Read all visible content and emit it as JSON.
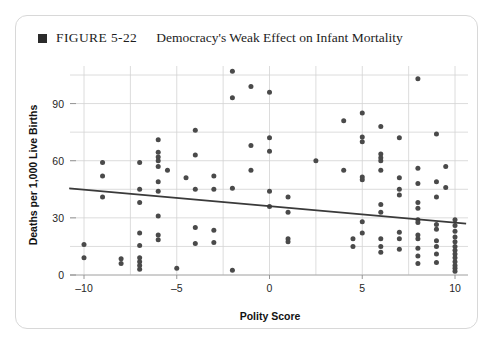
{
  "figure": {
    "bullet": "filled-square",
    "label": "FIGURE 5-22",
    "title": "Democracy's Weak Effect on Infant Mortality"
  },
  "chart_data": {
    "type": "scatter",
    "title": "Democracy's Weak Effect on Infant Mortality",
    "xlabel": "Polity Score",
    "ylabel": "Deaths per 1,000 Live Births",
    "xlim": [
      -11.5,
      11.5
    ],
    "ylim": [
      -5,
      110
    ],
    "xticks": [
      -10,
      -5,
      0,
      5,
      10
    ],
    "xticklabels": [
      "–10",
      "–5",
      "0",
      "5",
      "10"
    ],
    "yticks": [
      0,
      30,
      60,
      90
    ],
    "yticklabels": [
      "0",
      "30",
      "60",
      "90"
    ],
    "x_gridlines": [
      -10,
      -7.5,
      -5,
      -2.5,
      0,
      2.5,
      5,
      7.5,
      10
    ],
    "y_gridlines": [
      0,
      15,
      30,
      45,
      60,
      75,
      90,
      105
    ],
    "grid": true,
    "legend": "none",
    "marker_color": "#4a4a4a",
    "trendline": {
      "label": "linear fit",
      "color": "#3a3a3a",
      "x": [
        -10.8,
        10.6
      ],
      "y": [
        45.5,
        27.0
      ]
    },
    "points": [
      {
        "x": -10.0,
        "y": 16.0
      },
      {
        "x": -10.0,
        "y": 9.0
      },
      {
        "x": -9.0,
        "y": 59.0
      },
      {
        "x": -9.0,
        "y": 52.0
      },
      {
        "x": -9.0,
        "y": 41.0
      },
      {
        "x": -8.0,
        "y": 8.5
      },
      {
        "x": -8.0,
        "y": 6.0
      },
      {
        "x": -7.0,
        "y": 59.0
      },
      {
        "x": -7.0,
        "y": 45.0
      },
      {
        "x": -7.0,
        "y": 38.0
      },
      {
        "x": -7.0,
        "y": 22.0
      },
      {
        "x": -7.0,
        "y": 15.5
      },
      {
        "x": -7.0,
        "y": 9.0
      },
      {
        "x": -7.0,
        "y": 7.0
      },
      {
        "x": -7.0,
        "y": 5.0
      },
      {
        "x": -7.0,
        "y": 3.0
      },
      {
        "x": -6.0,
        "y": 71.0
      },
      {
        "x": -6.0,
        "y": 64.5
      },
      {
        "x": -6.0,
        "y": 62.0
      },
      {
        "x": -6.0,
        "y": 60.0
      },
      {
        "x": -6.0,
        "y": 57.0
      },
      {
        "x": -6.0,
        "y": 49.0
      },
      {
        "x": -6.0,
        "y": 44.0
      },
      {
        "x": -6.0,
        "y": 31.0
      },
      {
        "x": -6.0,
        "y": 21.0
      },
      {
        "x": -6.0,
        "y": 18.5
      },
      {
        "x": -5.5,
        "y": 55.0
      },
      {
        "x": -5.0,
        "y": 3.5
      },
      {
        "x": -4.5,
        "y": 51.0
      },
      {
        "x": -4.0,
        "y": 76.0
      },
      {
        "x": -4.0,
        "y": 63.0
      },
      {
        "x": -4.0,
        "y": 45.0
      },
      {
        "x": -4.0,
        "y": 25.0
      },
      {
        "x": -4.0,
        "y": 16.5
      },
      {
        "x": -3.0,
        "y": 52.0
      },
      {
        "x": -3.0,
        "y": 45.0
      },
      {
        "x": -3.0,
        "y": 23.5
      },
      {
        "x": -3.0,
        "y": 17.0
      },
      {
        "x": -2.0,
        "y": 107.0
      },
      {
        "x": -2.0,
        "y": 93.0
      },
      {
        "x": -2.0,
        "y": 45.5
      },
      {
        "x": -2.0,
        "y": 2.5
      },
      {
        "x": -1.0,
        "y": 99.0
      },
      {
        "x": -1.0,
        "y": 68.0
      },
      {
        "x": -1.0,
        "y": 55.0
      },
      {
        "x": 0.0,
        "y": 96.0
      },
      {
        "x": 0.0,
        "y": 72.0
      },
      {
        "x": 0.0,
        "y": 65.0
      },
      {
        "x": 0.0,
        "y": 44.0
      },
      {
        "x": 0.0,
        "y": 36.0
      },
      {
        "x": 1.0,
        "y": 41.0
      },
      {
        "x": 1.0,
        "y": 33.0
      },
      {
        "x": 1.0,
        "y": 19.0
      },
      {
        "x": 1.0,
        "y": 17.5
      },
      {
        "x": 2.5,
        "y": 60.0
      },
      {
        "x": 4.0,
        "y": 81.0
      },
      {
        "x": 4.0,
        "y": 55.0
      },
      {
        "x": 4.5,
        "y": 19.0
      },
      {
        "x": 4.5,
        "y": 15.0
      },
      {
        "x": 5.0,
        "y": 85.0
      },
      {
        "x": 5.0,
        "y": 72.5
      },
      {
        "x": 5.0,
        "y": 70.0
      },
      {
        "x": 5.0,
        "y": 51.5
      },
      {
        "x": 5.0,
        "y": 50.0
      },
      {
        "x": 5.0,
        "y": 28.0
      },
      {
        "x": 5.0,
        "y": 22.0
      },
      {
        "x": 6.0,
        "y": 78.0
      },
      {
        "x": 6.0,
        "y": 63.5
      },
      {
        "x": 6.0,
        "y": 61.5
      },
      {
        "x": 6.0,
        "y": 60.0
      },
      {
        "x": 6.0,
        "y": 55.0
      },
      {
        "x": 6.0,
        "y": 37.0
      },
      {
        "x": 6.0,
        "y": 33.0
      },
      {
        "x": 6.0,
        "y": 19.0
      },
      {
        "x": 6.0,
        "y": 15.0
      },
      {
        "x": 6.0,
        "y": 12.0
      },
      {
        "x": 7.0,
        "y": 72.0
      },
      {
        "x": 7.0,
        "y": 51.0
      },
      {
        "x": 7.0,
        "y": 45.0
      },
      {
        "x": 7.0,
        "y": 42.0
      },
      {
        "x": 7.0,
        "y": 22.5
      },
      {
        "x": 7.0,
        "y": 19.0
      },
      {
        "x": 7.0,
        "y": 13.5
      },
      {
        "x": 8.0,
        "y": 103.0
      },
      {
        "x": 8.0,
        "y": 56.0
      },
      {
        "x": 8.0,
        "y": 48.0
      },
      {
        "x": 8.0,
        "y": 38.0
      },
      {
        "x": 8.0,
        "y": 35.0
      },
      {
        "x": 8.0,
        "y": 29.0
      },
      {
        "x": 8.0,
        "y": 27.5
      },
      {
        "x": 8.0,
        "y": 21.0
      },
      {
        "x": 8.0,
        "y": 19.0
      },
      {
        "x": 8.0,
        "y": 14.0
      },
      {
        "x": 8.0,
        "y": 10.0
      },
      {
        "x": 8.0,
        "y": 6.0
      },
      {
        "x": 9.0,
        "y": 74.0
      },
      {
        "x": 9.0,
        "y": 49.0
      },
      {
        "x": 9.0,
        "y": 41.0
      },
      {
        "x": 9.0,
        "y": 26.5
      },
      {
        "x": 9.0,
        "y": 24.0
      },
      {
        "x": 9.0,
        "y": 18.0
      },
      {
        "x": 9.0,
        "y": 15.0
      },
      {
        "x": 9.0,
        "y": 11.0
      },
      {
        "x": 9.0,
        "y": 6.5
      },
      {
        "x": 9.5,
        "y": 57.0
      },
      {
        "x": 9.5,
        "y": 46.0
      },
      {
        "x": 10.0,
        "y": 29.0
      },
      {
        "x": 10.0,
        "y": 26.0
      },
      {
        "x": 10.0,
        "y": 23.0
      },
      {
        "x": 10.0,
        "y": 20.0
      },
      {
        "x": 10.0,
        "y": 17.5
      },
      {
        "x": 10.0,
        "y": 15.0
      },
      {
        "x": 10.0,
        "y": 13.0
      },
      {
        "x": 10.0,
        "y": 11.0
      },
      {
        "x": 10.0,
        "y": 9.0
      },
      {
        "x": 10.0,
        "y": 7.0
      },
      {
        "x": 10.0,
        "y": 5.0
      },
      {
        "x": 10.0,
        "y": 3.5
      },
      {
        "x": 10.0,
        "y": 2.0
      }
    ]
  }
}
